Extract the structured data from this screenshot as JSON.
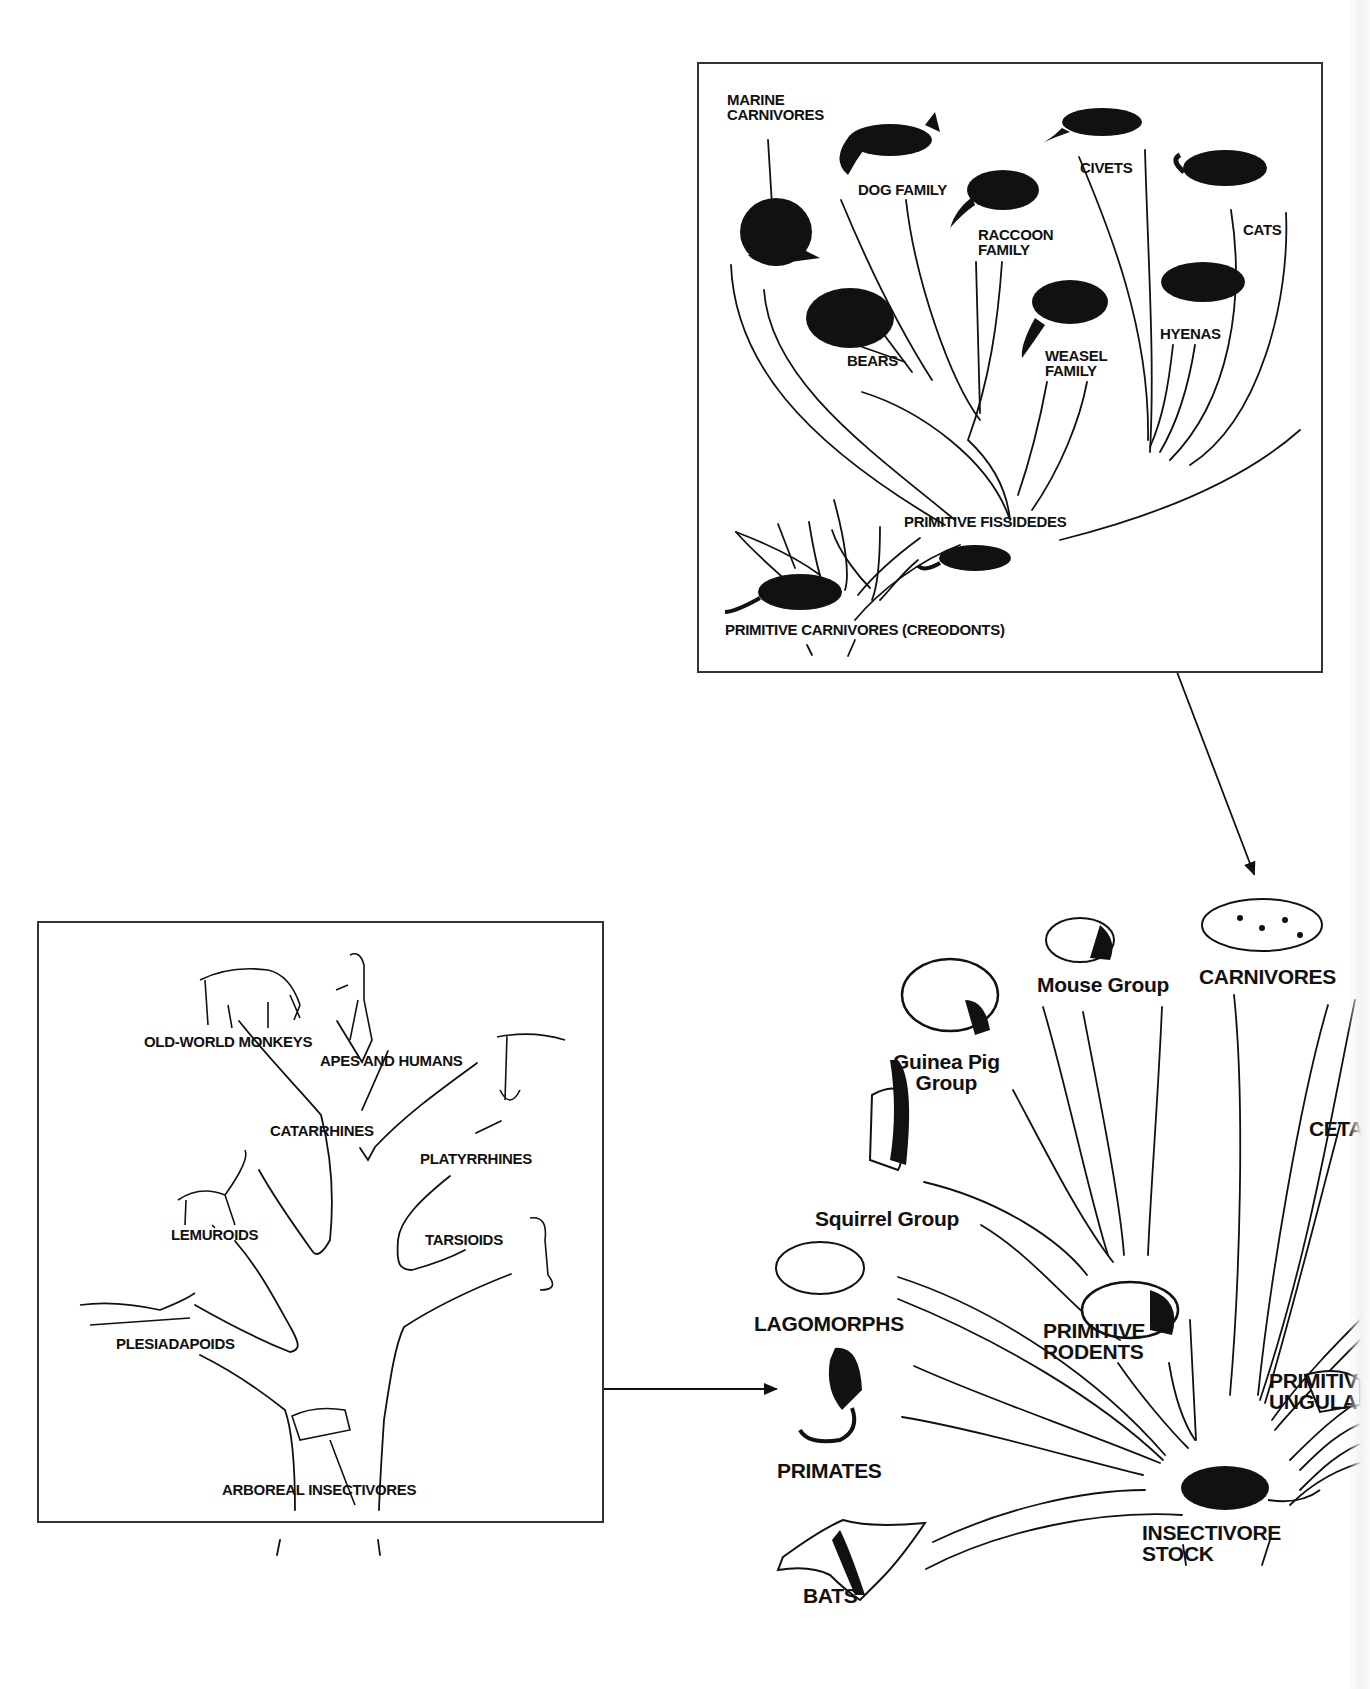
{
  "figure": {
    "colors": {
      "ink": "#111111",
      "border": "#333333",
      "background": "#ffffff"
    }
  },
  "carnivore_box": {
    "labels": {
      "marine_carnivores": "MARINE\nCARNIVORES",
      "dog_family": "DOG FAMILY",
      "civets": "CIVETS",
      "raccoon_family": "RACCOON\nFAMILY",
      "cats": "CATS",
      "bears": "BEARS",
      "weasel_family": "WEASEL\nFAMILY",
      "hyenas": "HYENAS",
      "primitive_fissidedes": "PRIMITIVE FISSIDEDES",
      "primitive_carnivores": "PRIMITIVE CARNIVORES (CREODONTS)"
    },
    "animals": [
      "walrus",
      "fox",
      "civet",
      "raccoon",
      "cat",
      "bear",
      "weasel",
      "hyena",
      "creodont",
      "fissiped"
    ]
  },
  "primate_box": {
    "labels": {
      "old_world_monkeys": "OLD-WORLD MONKEYS",
      "apes_and_humans": "APES AND HUMANS",
      "catarrhines": "CATARRHINES",
      "platyrrhines": "PLATYRRHINES",
      "lemuroids": "LEMUROIDS",
      "tarsioids": "TARSIOIDS",
      "plesiadapoids": "PLESIADAPOIDS",
      "arboreal_insectivores": "ARBOREAL INSECTIVORES"
    },
    "animals": [
      "baboon",
      "ape",
      "spider-monkey",
      "lemur",
      "tarsier",
      "plesiadapis",
      "tree-shrew"
    ]
  },
  "mammal_radiation": {
    "labels": {
      "mouse_group": "Mouse Group",
      "carnivores": "CARNIVORES",
      "guinea_pig_group": "Guinea Pig\nGroup",
      "cetaceans_partial": "CETA",
      "squirrel_group": "Squirrel Group",
      "lagomorphs": "LAGOMORPHS",
      "primitive_rodents": "PRIMITIVE\nRODENTS",
      "primitive_ungulates_partial": "PRIMITIV\nUNGULA",
      "primates": "PRIMATES",
      "insectivore_stock": "INSECTIVORE\nSTOCK",
      "bats": "BATS"
    },
    "animals": [
      "mouse",
      "leopard",
      "capybara",
      "squirrel",
      "rabbit",
      "primitive-rodent",
      "monkey",
      "ungulate",
      "shrew",
      "bat"
    ]
  },
  "arrows": [
    {
      "from": "carnivore_box",
      "to": "carnivores"
    },
    {
      "from": "primate_box",
      "to": "primates"
    }
  ]
}
